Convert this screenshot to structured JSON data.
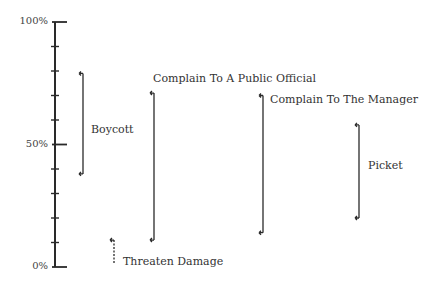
{
  "chart_data": {
    "type": "range",
    "title": "",
    "xlabel": "",
    "ylabel": "",
    "ylim": [
      0,
      100
    ],
    "yticks": [
      0,
      10,
      20,
      30,
      40,
      50,
      60,
      70,
      80,
      90,
      100
    ],
    "ytick_labels": {
      "0": "0%",
      "50": "50%",
      "100": "100%"
    },
    "grid": false,
    "legend": false,
    "series": [
      {
        "name": "Boycott",
        "low": 38,
        "high": 79,
        "style": "solid"
      },
      {
        "name": "Complain To A Public Official",
        "low": 11,
        "high": 71,
        "style": "solid"
      },
      {
        "name": "Complain To The Manager",
        "low": 14,
        "high": 70,
        "style": "solid"
      },
      {
        "name": "Picket",
        "low": 20,
        "high": 58,
        "style": "solid"
      },
      {
        "name": "Threaten Damage",
        "low": 1,
        "high": 11,
        "style": "dashed"
      }
    ]
  },
  "axis": {
    "label_top": "100%",
    "label_mid": "50%",
    "label_bottom": "0%"
  },
  "labels": {
    "boycott": "Boycott",
    "public_official": "Complain To A Public Official",
    "manager": "Complain To The Manager",
    "picket": "Picket",
    "threaten": "Threaten Damage"
  },
  "colors": {
    "ink": "#2a2a2a",
    "background": "#ffffff"
  }
}
